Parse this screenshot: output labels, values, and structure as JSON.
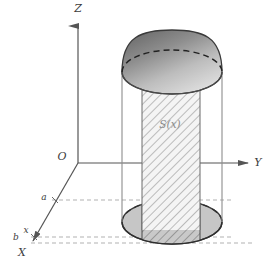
{
  "figure": {
    "kind": "math-diagram",
    "background_color": "#ffffff"
  },
  "axes": {
    "z": {
      "label": "Z",
      "name": "z-axis",
      "label_x": 78,
      "label_y": 12
    },
    "y": {
      "label": "Y",
      "name": "y-axis",
      "label_x": 258,
      "label_y": 166
    },
    "x": {
      "label": "X",
      "name": "x-axis",
      "label_x": 22,
      "label_y": 256
    },
    "origin": {
      "label": "O",
      "name": "origin",
      "label_x": 62,
      "label_y": 160
    },
    "stroke_color": "#555555"
  },
  "marks": {
    "a": {
      "label": "a",
      "x": 44,
      "y": 200
    },
    "b": {
      "label": "b",
      "x": 16,
      "y": 240
    },
    "x": {
      "label": "x",
      "x": 26,
      "y": 233
    }
  },
  "cross_section": {
    "label": "S(x)",
    "label_x": 170,
    "label_y": 128,
    "hatch_color": "#8c8c8c",
    "fill_color": "#f2f2f2"
  },
  "solid": {
    "cylinder": {
      "left": 122,
      "right": 222,
      "top_y": 72,
      "bottom_y": 222,
      "ellipse_ry": 22,
      "side_fill": "#ffffff",
      "stroke": "#4a4a4a"
    },
    "dome": {
      "apex_y": 30,
      "base_y": 72,
      "fill_top": "#6e6e6e",
      "fill_bottom": "#d8d8d8",
      "stroke": "#3a3a3a"
    },
    "base_ellipse": {
      "center_x": 172,
      "center_y": 222,
      "rx": 50,
      "ry": 22,
      "fill": "#c6c6c6",
      "stroke": "#3a3a3a"
    }
  },
  "guides": {
    "dashed_color": "#a8a8a8",
    "lines": [
      {
        "name": "guide-line-a",
        "y": 200,
        "x_start": 52,
        "x_end": 232
      },
      {
        "name": "guide-line-b",
        "y": 237,
        "x_start": 30,
        "x_end": 232
      },
      {
        "name": "guide-line-b-lower",
        "y": 243,
        "x_start": 30,
        "x_end": 250
      }
    ]
  }
}
